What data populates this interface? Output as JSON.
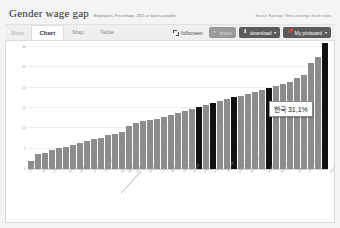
{
  "header": {
    "title": "Gender wage gap",
    "subtitle": "Employees, Percentage, 2021 or latest available",
    "source": "Source: Earnings: Gross earnings: decile ratios"
  },
  "toolbar": {
    "show_label": "Show",
    "tabs": [
      {
        "label": "Chart",
        "active": true
      },
      {
        "label": "Map",
        "active": false
      },
      {
        "label": "Table",
        "active": false
      }
    ],
    "fullscreen_label": "fullscreen",
    "share_label": "share",
    "download_label": "download",
    "pinboard_label": "My pinboard",
    "caret": "▾",
    "button_color": "#5a5a5a",
    "button_disabled_color": "#9a9a9a"
  },
  "tooltip": {
    "text": "한국 31,1%",
    "country": "한국",
    "value": "31,1%"
  },
  "chart_data": {
    "type": "bar",
    "title": "Gender wage gap",
    "subtitle": "Employees, Percentage, 2021 or latest available",
    "xlabel": "",
    "ylabel": "",
    "ylim": [
      0,
      30
    ],
    "yticks": [
      0,
      5,
      10,
      15,
      20,
      25,
      30
    ],
    "ytick_labels": [
      "0",
      "5",
      "10",
      "15",
      "20",
      "25",
      "30"
    ],
    "grid": true,
    "legend": false,
    "bar_color": "#8c8c8c",
    "highlight_color": "#111111",
    "highlight_note": "Dark bars mark selected/aggregate economies; the final dark bar is Korea at 31.1%",
    "categories": [
      "Colombia",
      "Belgium",
      "Costa Rica",
      "Norway",
      "Denmark",
      "Greece",
      "Luxembourg",
      "Italy",
      "Spain",
      "Romania",
      "Sweden",
      "Ireland",
      "Slovenia",
      "Turkey",
      "Iceland",
      "France",
      "Portugal",
      "Lithuania",
      "Poland",
      "New Zealand",
      "Australia",
      "Netherlands",
      "Austria",
      "Czech Republic",
      "Slovak Republic",
      "Chile",
      "Switzerland",
      "Germany",
      "Brazil",
      "OECD - Average",
      "Hungary",
      "Mexico",
      "Argentina",
      "United Kingdom",
      "European Union",
      "Finland",
      "United States",
      "Canada",
      "Estonia",
      "Latvia",
      "Japan",
      "Israel",
      "Korea"
    ],
    "values": [
      1.9,
      3.6,
      4.0,
      4.6,
      5.1,
      5.5,
      6.0,
      6.4,
      7.0,
      7.4,
      7.7,
      8.3,
      8.7,
      9.1,
      10.5,
      11.2,
      11.8,
      12.0,
      12.4,
      12.9,
      13.4,
      13.8,
      14.2,
      14.8,
      15.3,
      15.7,
      16.2,
      16.8,
      17.2,
      17.6,
      18.0,
      18.5,
      19.0,
      19.5,
      20.0,
      20.3,
      21.0,
      21.5,
      22.3,
      23.0,
      26.0,
      27.5,
      31.1
    ],
    "highlighted": [
      false,
      false,
      false,
      false,
      false,
      false,
      false,
      false,
      false,
      false,
      false,
      false,
      false,
      false,
      false,
      false,
      false,
      false,
      false,
      false,
      false,
      false,
      false,
      false,
      true,
      false,
      true,
      false,
      false,
      true,
      false,
      false,
      false,
      false,
      true,
      false,
      false,
      false,
      false,
      false,
      false,
      false,
      true
    ]
  }
}
